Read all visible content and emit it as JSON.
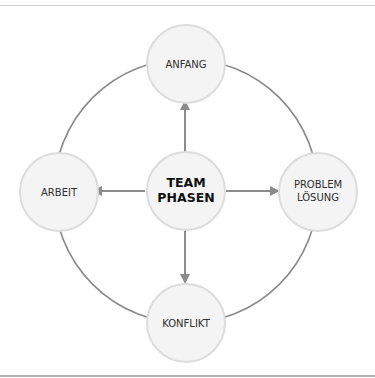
{
  "diagram": {
    "type": "hub-and-cycle",
    "colors": {
      "ring": "#8a8a8a",
      "arrow": "#8c8c8c",
      "node_fill": "#f4f4f4",
      "node_stroke": "#dcdcdc",
      "label": "#2e2e2e",
      "center_label": "#111111"
    },
    "center": {
      "lines": [
        "TEAM",
        "PHASEN"
      ]
    },
    "nodes": [
      {
        "id": "top",
        "lines": [
          "ANFANG"
        ]
      },
      {
        "id": "right",
        "lines": [
          "PROBLEM",
          "LÖSUNG"
        ]
      },
      {
        "id": "bottom",
        "lines": [
          "KONFLIKT"
        ]
      },
      {
        "id": "left",
        "lines": [
          "ARBEIT"
        ]
      }
    ],
    "edges": [
      {
        "from": "center",
        "to": "top",
        "arrow": true
      },
      {
        "from": "center",
        "to": "right",
        "arrow": true
      },
      {
        "from": "center",
        "to": "bottom",
        "arrow": true
      },
      {
        "from": "center",
        "to": "left",
        "arrow": true
      }
    ],
    "outer_ring": "connects top, right, bottom, left nodes in a circle"
  }
}
